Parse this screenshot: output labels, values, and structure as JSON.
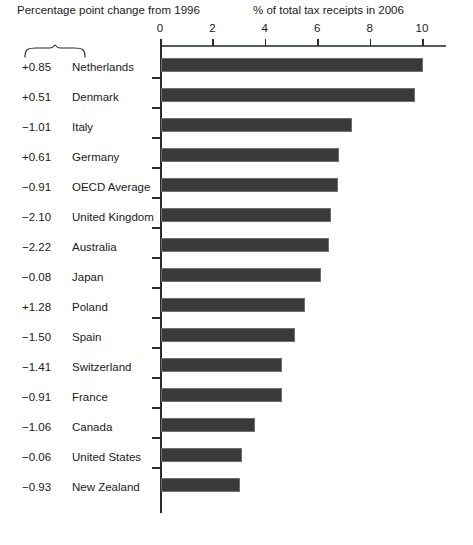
{
  "header": {
    "left_label": "Percentage point change from 1996",
    "right_label": "% of total tax receipts in 2006"
  },
  "colors": {
    "bar_fill": "#3a3a3a",
    "bar_stroke": "#6f6f6f",
    "axis": "#2b2b2b",
    "text": "#1a1a1a",
    "background": "#ffffff"
  },
  "chart_data": {
    "type": "bar",
    "orientation": "horizontal",
    "title": "",
    "subtitle": "",
    "xlabel": "% of total tax receipts in 2006",
    "ylabel": "",
    "xlim": [
      0,
      10.9
    ],
    "xticks": [
      0,
      2,
      4,
      6,
      8,
      10
    ],
    "xtick_labels": [
      "0",
      "2",
      "4",
      "6",
      "8",
      "10"
    ],
    "grid": false,
    "legend": null,
    "axis_position": "top",
    "categories": [
      "Netherlands",
      "Denmark",
      "Italy",
      "Germany",
      "OECD Average",
      "United Kingdom",
      "Australia",
      "Japan",
      "Poland",
      "Spain",
      "Switzerland",
      "France",
      "Canada",
      "United States",
      "New Zealand"
    ],
    "values": [
      10.0,
      9.7,
      7.3,
      6.8,
      6.75,
      6.5,
      6.4,
      6.1,
      5.5,
      5.1,
      4.6,
      4.6,
      3.6,
      3.1,
      3.0
    ],
    "annotations": {
      "label": "Percentage point change from 1996",
      "values": [
        "+0.85",
        "+0.51",
        "−1.01",
        "+0.61",
        "−0.91",
        "−2.10",
        "−2.22",
        "−0.08",
        "+1.28",
        "−1.50",
        "−1.41",
        "−0.91",
        "−1.06",
        "−0.06",
        "−0.93"
      ]
    },
    "rows": [
      {
        "change": "+0.85",
        "country": "Netherlands",
        "value": 10.0
      },
      {
        "change": "+0.51",
        "country": "Denmark",
        "value": 9.7
      },
      {
        "change": "−1.01",
        "country": "Italy",
        "value": 7.3
      },
      {
        "change": "+0.61",
        "country": "Germany",
        "value": 6.8
      },
      {
        "change": "−0.91",
        "country": "OECD Average",
        "value": 6.75
      },
      {
        "change": "−2.10",
        "country": "United Kingdom",
        "value": 6.5
      },
      {
        "change": "−2.22",
        "country": "Australia",
        "value": 6.4
      },
      {
        "change": "−0.08",
        "country": "Japan",
        "value": 6.1
      },
      {
        "change": "+1.28",
        "country": "Poland",
        "value": 5.5
      },
      {
        "change": "−1.50",
        "country": "Spain",
        "value": 5.1
      },
      {
        "change": "−1.41",
        "country": "Switzerland",
        "value": 4.6
      },
      {
        "change": "−0.91",
        "country": "France",
        "value": 4.6
      },
      {
        "change": "−1.06",
        "country": "Canada",
        "value": 3.6
      },
      {
        "change": "−0.06",
        "country": "United States",
        "value": 3.1
      },
      {
        "change": "−0.93",
        "country": "New Zealand",
        "value": 3.0
      }
    ]
  }
}
